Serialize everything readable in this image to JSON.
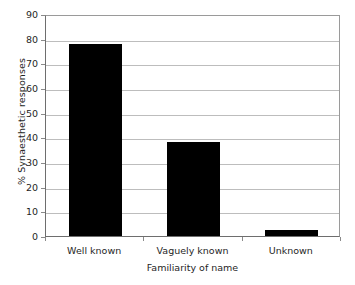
{
  "chart_data": {
    "type": "bar",
    "title": "",
    "subtitle": "",
    "xlabel": "Familiarity of name",
    "ylabel": "% Synaesthetic responses",
    "categories": [
      "Well known",
      "Vaguely known",
      "Unknown"
    ],
    "values": [
      78,
      38,
      2.5
    ],
    "series": [
      {
        "name": "% Synaesthetic responses",
        "values": [
          78,
          38,
          2.5
        ]
      }
    ],
    "ylim": [
      0,
      90
    ],
    "ytick_labels": [
      "90",
      "80",
      "70",
      "60",
      "50",
      "40",
      "30",
      "20",
      "10",
      "0"
    ],
    "ytick_values": [
      90,
      80,
      70,
      60,
      50,
      40,
      30,
      20,
      10,
      0
    ],
    "ytick_step": 10,
    "grid": "horizontal",
    "legend": "none",
    "annotations": [],
    "colors": {
      "bar": "#000000",
      "gridline": "#bdbdbd",
      "axis": "#6e6e6e",
      "plot_border": "#9a9a9a",
      "text": "#1f1f1f",
      "background": "#ffffff"
    }
  }
}
